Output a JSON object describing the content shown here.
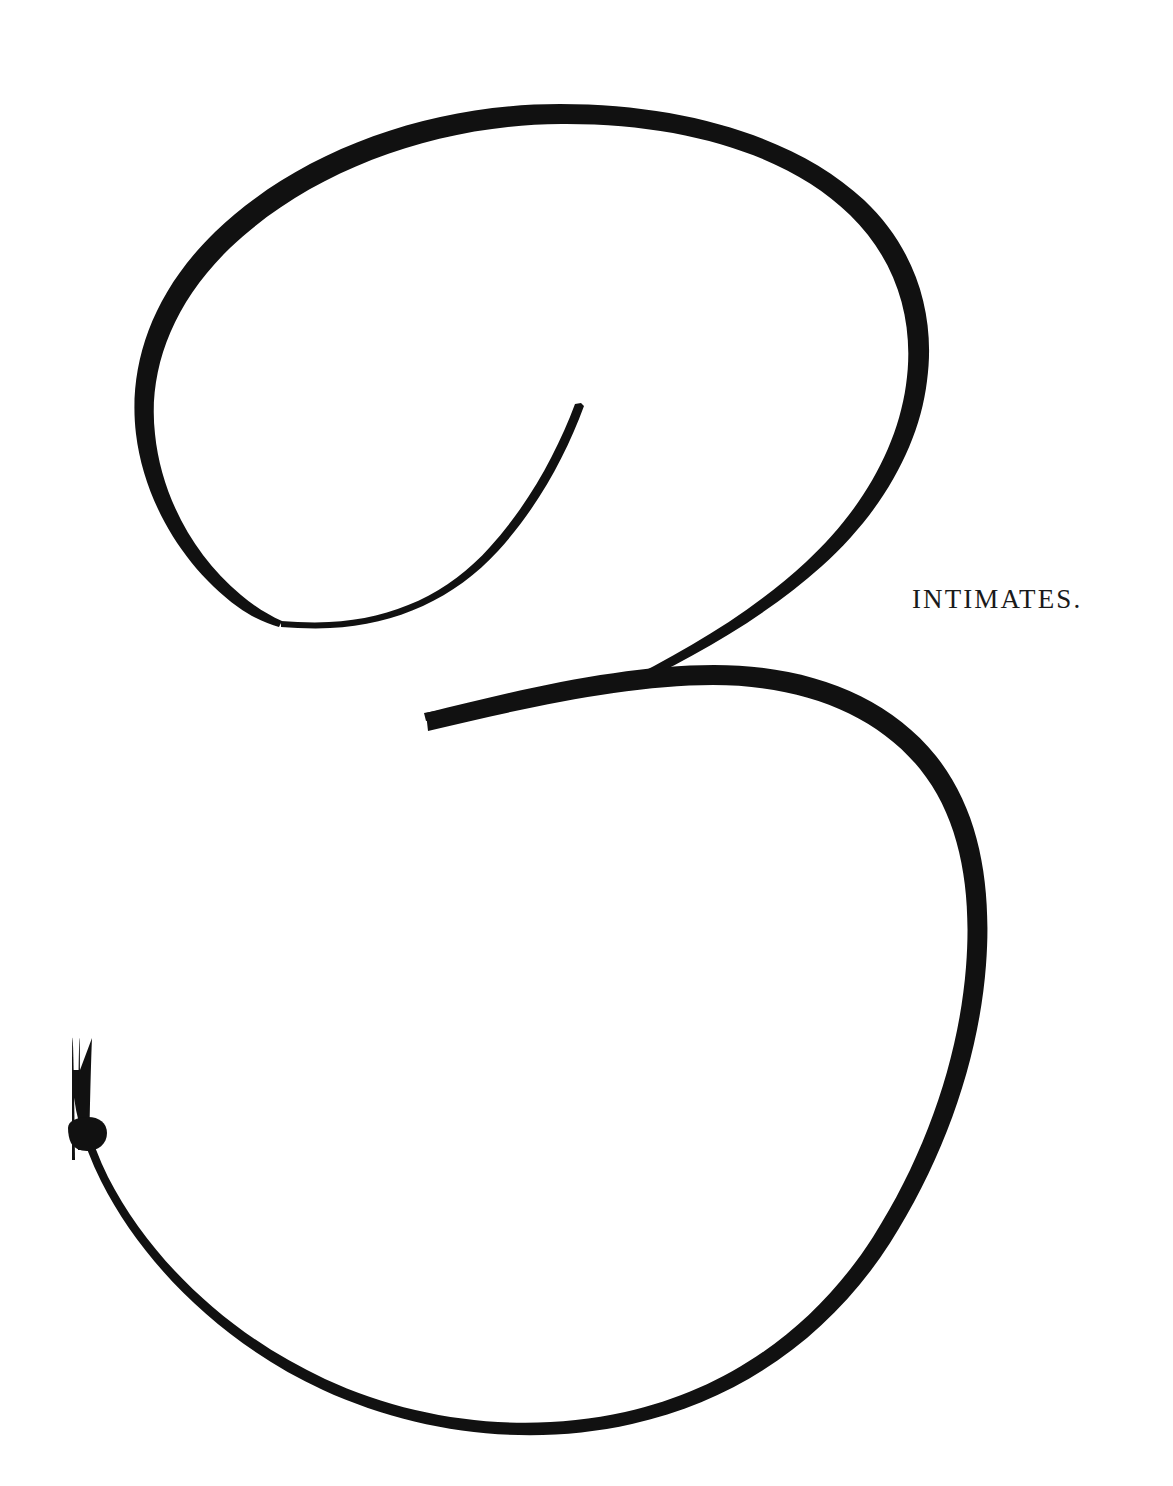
{
  "page": {
    "width": 1173,
    "height": 1486,
    "background_color": "#ffffff",
    "ink_color": "#111111"
  },
  "section_label": {
    "text": "INTIMATES.",
    "color": "#1a1a1a",
    "position": {
      "x": 912,
      "y": 586
    },
    "style": "small-caps serif, letter-spaced"
  },
  "numeral": {
    "character": "3",
    "name": "chapter-numeral-three",
    "style": "ornamental copperplate / modulated-stroke calligraphic numeral",
    "color": "#111111",
    "bounding_box": {
      "x": 66,
      "y": 100,
      "width": 925,
      "height": 1338
    },
    "strokes": [
      {
        "name": "upper-bowl",
        "description": "large open bowl, hairline at top-left, swelling to a thick shade on the right flank, tapering again toward the lower-left terminal",
        "min_width_px": 3,
        "max_width_px": 14,
        "extent": {
          "left": 133,
          "top": 104,
          "right": 906,
          "bottom": 628
        }
      },
      {
        "name": "inner-flourish",
        "description": "hairline spur descending from a fine point inside the bowl, curving left and merging into the bowl floor",
        "min_width_px": 1,
        "max_width_px": 4,
        "tip": {
          "x": 581,
          "y": 403
        }
      },
      {
        "name": "diagonal-junction-stroke",
        "description": "straight-cut diagonal joining the upper bowl down to the shoulder of the lower bowl, blunt cut terminal at lower-left",
        "terminal": {
          "x": 424,
          "y": 716
        },
        "width_px": 5
      },
      {
        "name": "lower-bowl",
        "description": "wider descending bowl, hairline along the top and bottom, heaviest shade on the right flank",
        "min_width_px": 2,
        "max_width_px": 13,
        "extent": {
          "left": 72,
          "top": 659,
          "right": 986,
          "bottom": 1432
        }
      },
      {
        "name": "ball-terminal",
        "description": "teardrop ball finial closing the lower-left tail",
        "center": {
          "x": 86,
          "y": 1132
        },
        "diameter_px": 34
      }
    ]
  }
}
